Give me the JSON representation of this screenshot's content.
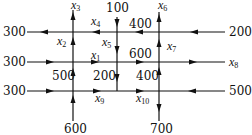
{
  "nodes": [
    "A",
    "B",
    "C",
    "D",
    "E",
    "F",
    "G"
  ],
  "external_flows": [
    {
      "label": "300",
      "position": "top-left",
      "direction": "out"
    },
    {
      "label": "300",
      "position": "middle-left",
      "direction": "in"
    },
    {
      "label": "300",
      "position": "bottom-left",
      "direction": "in"
    },
    {
      "label": "100",
      "position": "top-center",
      "direction": "in"
    },
    {
      "label": "200",
      "position": "top-right",
      "direction": "in"
    },
    {
      "label": "600",
      "position": "bottom-left-vertical",
      "direction": "in"
    },
    {
      "label": "700",
      "position": "bottom-right-vertical",
      "direction": "out"
    },
    {
      "label": "500",
      "position": "bottom-right",
      "direction": "in"
    }
  ],
  "internal_values": [
    {
      "label": "400",
      "position": "top-right-segment"
    },
    {
      "label": "600",
      "position": "middle-right-segment"
    },
    {
      "label": "500",
      "position": "left-vertical-lower"
    },
    {
      "label": "200",
      "position": "center-vertical-lower"
    },
    {
      "label": "400",
      "position": "right-vertical-lower"
    }
  ],
  "variables": [
    {
      "name": "x",
      "sub": "1"
    },
    {
      "name": "x",
      "sub": "2"
    },
    {
      "name": "x",
      "sub": "3"
    },
    {
      "name": "x",
      "sub": "4"
    },
    {
      "name": "x",
      "sub": "5"
    },
    {
      "name": "x",
      "sub": "6"
    },
    {
      "name": "x",
      "sub": "7"
    },
    {
      "name": "x",
      "sub": "8"
    },
    {
      "name": "x",
      "sub": "9"
    },
    {
      "name": "x",
      "sub": "10"
    }
  ]
}
